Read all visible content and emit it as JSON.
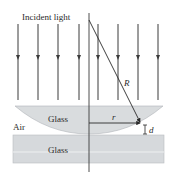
{
  "diagram": {
    "labels": {
      "incident_light": "Incident light",
      "air": "Air",
      "glass_lens": "Glass",
      "glass_plate": "Glass",
      "radius_R": "R",
      "radius_r": "r",
      "gap_d": "d"
    },
    "colors": {
      "background": "#ffffff",
      "lens_fill": "#d9dcde",
      "plate_fill": "#d6d9dc",
      "line": "#3a3a3a",
      "text": "#2a2a2a"
    },
    "rays_x": [
      18,
      38,
      58,
      79,
      98,
      118,
      138,
      158
    ]
  }
}
